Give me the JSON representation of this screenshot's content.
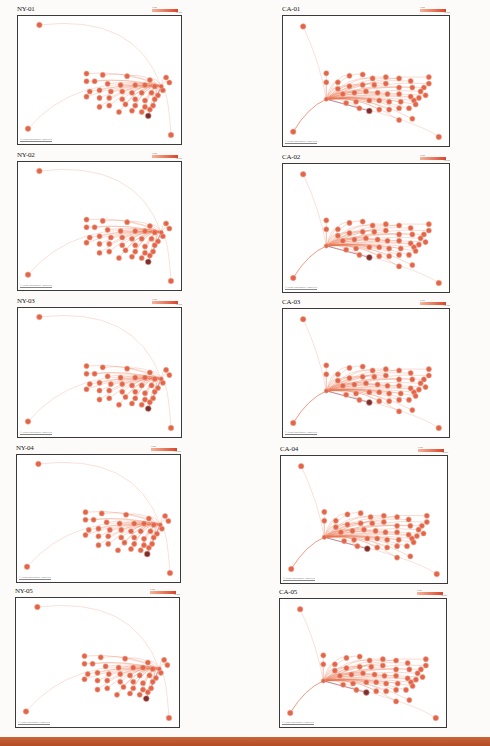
{
  "document": {
    "footer_color": "#b8532a"
  },
  "colors": {
    "node": "#e2654a",
    "node_stroke": "#f2a48c",
    "dark_node": "#7a2e2e",
    "edge_light": "#f3cfc4",
    "edge": "#e8734f",
    "legend_low": "#f6b49a",
    "legend_high": "#d9442a"
  },
  "panels": [
    {
      "id": "ny-01",
      "title": "NY-01",
      "type": "ny",
      "x": 17,
      "y": 15,
      "w": 165,
      "h": 130,
      "legend": {
        "label": "Flows",
        "scale": "100 200"
      },
      "attribution": "© OSM contributors / MapTiles"
    },
    {
      "id": "ca-01",
      "title": "CA-01",
      "type": "ca",
      "x": 282,
      "y": 15,
      "w": 168,
      "h": 132,
      "legend": {
        "label": "Flows",
        "scale": "100 200"
      },
      "attribution": "© OSM contributors / MapTiles"
    },
    {
      "id": "ny-02",
      "title": "NY-02",
      "type": "ny",
      "x": 17,
      "y": 161,
      "w": 165,
      "h": 130,
      "legend": {
        "label": "Flows",
        "scale": "100 200"
      },
      "attribution": "© OSM contributors / MapTiles"
    },
    {
      "id": "ca-02",
      "title": "CA-02",
      "type": "ca",
      "x": 282,
      "y": 163,
      "w": 168,
      "h": 130,
      "legend": {
        "label": "Flows",
        "scale": "100 200"
      },
      "attribution": "© OSM contributors / MapTiles"
    },
    {
      "id": "ny-03",
      "title": "NY-03",
      "type": "ny",
      "x": 17,
      "y": 307,
      "w": 165,
      "h": 131,
      "legend": {
        "label": "Flows",
        "scale": "100 200"
      },
      "attribution": "© OSM contributors / MapTiles"
    },
    {
      "id": "ca-03",
      "title": "CA-03",
      "type": "ca",
      "x": 282,
      "y": 308,
      "w": 168,
      "h": 130,
      "legend": {
        "label": "Flows",
        "scale": "100 200"
      },
      "attribution": "© OSM contributors / MapTiles"
    },
    {
      "id": "ny-04",
      "title": "NY-04",
      "type": "ny",
      "x": 16,
      "y": 454,
      "w": 165,
      "h": 129,
      "legend": {
        "label": "Flows",
        "scale": "100 200"
      },
      "attribution": "© OSM contributors / MapTiles"
    },
    {
      "id": "ca-04",
      "title": "CA-04",
      "type": "ca",
      "x": 280,
      "y": 455,
      "w": 168,
      "h": 129,
      "legend": {
        "label": "Flows",
        "scale": "100 200"
      },
      "attribution": "© OSM contributors / MapTiles"
    },
    {
      "id": "ny-05",
      "title": "NY-05",
      "type": "ny",
      "x": 15,
      "y": 597,
      "w": 165,
      "h": 131,
      "legend": {
        "label": "Flows",
        "scale": "100 200"
      },
      "attribution": "© OSM contributors / MapTiles"
    },
    {
      "id": "ca-05",
      "title": "CA-05",
      "type": "ca",
      "x": 279,
      "y": 598,
      "w": 168,
      "h": 130,
      "legend": {
        "label": "Flows",
        "scale": "100 200"
      },
      "attribution": "© OSM contributors / MapTiles"
    }
  ],
  "layouts": {
    "ny": {
      "hub": [
        88,
        55
      ],
      "outliers": [
        [
          13,
          7
        ],
        [
          6,
          88
        ],
        [
          94,
          93
        ]
      ],
      "dark": [
        80,
        78
      ],
      "cluster": [
        [
          42,
          45
        ],
        [
          52,
          46
        ],
        [
          67,
          47
        ],
        [
          81,
          50
        ],
        [
          91,
          48
        ],
        [
          93,
          52
        ],
        [
          42,
          51
        ],
        [
          47,
          51
        ],
        [
          55,
          53
        ],
        [
          63,
          54
        ],
        [
          72,
          54
        ],
        [
          78,
          54
        ],
        [
          84,
          55
        ],
        [
          89,
          58
        ],
        [
          44,
          59
        ],
        [
          50,
          58
        ],
        [
          57,
          59
        ],
        [
          64,
          59
        ],
        [
          70,
          60
        ],
        [
          76,
          60
        ],
        [
          82,
          60
        ],
        [
          86,
          62
        ],
        [
          42,
          63
        ],
        [
          50,
          64
        ],
        [
          56,
          64
        ],
        [
          64,
          65
        ],
        [
          72,
          65
        ],
        [
          78,
          66
        ],
        [
          84,
          65
        ],
        [
          50,
          71
        ],
        [
          56,
          70
        ],
        [
          66,
          69
        ],
        [
          72,
          70
        ],
        [
          78,
          71
        ],
        [
          83,
          70
        ],
        [
          62,
          75
        ],
        [
          70,
          74
        ],
        [
          76,
          75
        ],
        [
          81,
          73
        ]
      ]
    },
    "ca": {
      "hub": [
        26,
        64
      ],
      "outliers": [
        [
          12,
          8
        ],
        [
          6,
          89
        ],
        [
          94,
          93
        ]
      ],
      "dark": [
        52,
        73
      ],
      "cluster": [
        [
          26,
          44
        ],
        [
          26,
          51
        ],
        [
          33,
          51
        ],
        [
          40,
          46
        ],
        [
          48,
          45
        ],
        [
          54,
          48
        ],
        [
          62,
          47
        ],
        [
          70,
          48
        ],
        [
          77,
          50
        ],
        [
          88,
          47
        ],
        [
          33,
          56
        ],
        [
          40,
          54
        ],
        [
          48,
          53
        ],
        [
          55,
          53
        ],
        [
          62,
          52
        ],
        [
          70,
          55
        ],
        [
          78,
          55
        ],
        [
          85,
          55
        ],
        [
          88,
          52
        ],
        [
          36,
          60
        ],
        [
          43,
          59
        ],
        [
          50,
          58
        ],
        [
          57,
          59
        ],
        [
          63,
          60
        ],
        [
          70,
          60
        ],
        [
          77,
          62
        ],
        [
          83,
          58
        ],
        [
          86,
          61
        ],
        [
          38,
          67
        ],
        [
          44,
          66
        ],
        [
          52,
          65
        ],
        [
          58,
          65
        ],
        [
          64,
          66
        ],
        [
          71,
          66
        ],
        [
          79,
          65
        ],
        [
          82,
          63
        ],
        [
          46,
          71
        ],
        [
          58,
          72
        ],
        [
          64,
          72
        ],
        [
          70,
          71
        ],
        [
          76,
          71
        ],
        [
          80,
          68
        ],
        [
          70,
          80
        ],
        [
          78,
          79
        ]
      ]
    }
  }
}
